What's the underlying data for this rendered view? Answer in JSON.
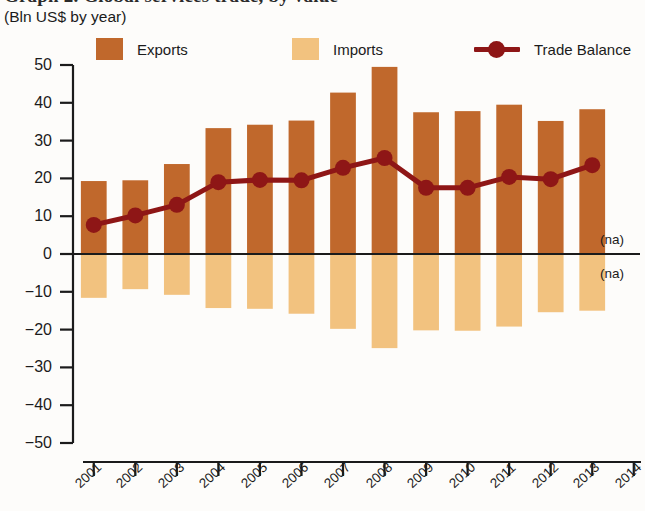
{
  "header": {
    "title": "Graph 2. Global services trade, by value",
    "subtitle": "(Bln US$ by year)"
  },
  "legend": {
    "position": "top",
    "items": [
      {
        "label": "Exports",
        "marker": "square-swatch",
        "color": "#c0682c"
      },
      {
        "label": "Imports",
        "marker": "square-swatch",
        "color": "#f2c27f"
      },
      {
        "label": "Trade Balance",
        "marker": "line-with-circle",
        "color": "#8e1616"
      }
    ]
  },
  "annotations": {
    "na_upper": "(na)",
    "na_lower": "(na)"
  },
  "colors": {
    "exports": "#c0682c",
    "imports": "#f2c27f",
    "trade_balance": "#8e1616",
    "axis": "#1b1b1b",
    "background": "#fdfcfa"
  },
  "chart_data": {
    "type": "bar",
    "title": "Graph 2. Global services trade, by value",
    "subtitle": "(Bln US$ by year)",
    "xlabel": "",
    "ylabel": "",
    "ylim": [
      -50,
      50
    ],
    "ytick_step": 10,
    "yticks": [
      50,
      40,
      30,
      20,
      10,
      0,
      -10,
      -20,
      -30,
      -40,
      -50
    ],
    "ytick_labels": [
      "50",
      "40",
      "30",
      "20",
      "10",
      "0",
      "−10",
      "−20",
      "−30",
      "−40",
      "−50"
    ],
    "grid": false,
    "categories": [
      "2001",
      "2002",
      "2003",
      "2004",
      "2005",
      "2006",
      "2007",
      "2008",
      "2009",
      "2010",
      "2011",
      "2012",
      "2013",
      "2014"
    ],
    "xtick_labels": [
      "2001",
      "2002",
      "2003",
      "2004",
      "2005",
      "2006",
      "2007",
      "2008",
      "2009",
      "2010",
      "2011",
      "2012",
      "2013",
      "2014"
    ],
    "series": [
      {
        "name": "Exports",
        "type": "bar",
        "color": "#c0682c",
        "values": [
          19.3,
          19.5,
          23.8,
          33.3,
          34.2,
          35.3,
          42.7,
          49.5,
          37.5,
          37.8,
          39.5,
          35.2,
          38.3,
          null
        ]
      },
      {
        "name": "Imports",
        "type": "bar",
        "color": "#f2c27f",
        "values": [
          -11.6,
          -9.3,
          -10.8,
          -14.3,
          -14.5,
          -15.8,
          -19.8,
          -24.9,
          -20.2,
          -20.3,
          -19.2,
          -15.4,
          -15.0,
          null
        ]
      },
      {
        "name": "Trade Balance",
        "type": "line",
        "color": "#8e1616",
        "values": [
          7.7,
          10.2,
          13.0,
          19.0,
          19.6,
          19.5,
          22.8,
          25.4,
          17.5,
          17.5,
          20.4,
          19.8,
          23.5,
          null
        ]
      }
    ]
  }
}
